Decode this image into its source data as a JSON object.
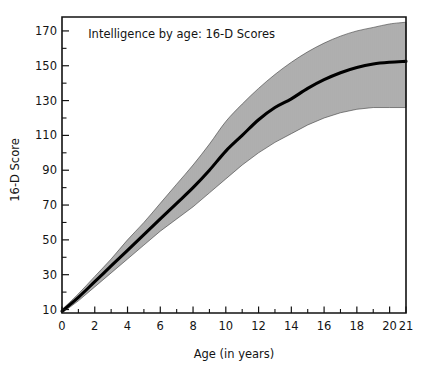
{
  "chart_data": {
    "type": "line",
    "title": "Intelligence by age: 16-D Scores",
    "xlabel": "Age (in years)",
    "ylabel": "16-D Score",
    "grid": false,
    "legend": "none",
    "xlim": [
      0,
      21
    ],
    "ylim": [
      8,
      178
    ],
    "x_ticks": [
      0,
      2,
      4,
      6,
      8,
      10,
      12,
      14,
      16,
      18,
      20,
      21
    ],
    "x_tick_labels": [
      "0",
      "2",
      "4",
      "6",
      "8",
      "10",
      "12",
      "14",
      "16",
      "18",
      "20",
      "21"
    ],
    "x_minor_ticks": [
      1,
      3,
      5,
      7,
      9,
      11,
      13,
      15,
      17,
      19
    ],
    "y_ticks": [
      10,
      30,
      50,
      70,
      90,
      110,
      130,
      150,
      170
    ],
    "y_tick_labels": [
      "10",
      "30",
      "50",
      "70",
      "90",
      "110",
      "130",
      "150",
      "170"
    ],
    "y_minor_ticks": [
      20,
      40,
      60,
      80,
      100,
      120,
      140,
      160
    ],
    "x": [
      0,
      1,
      2,
      3,
      4,
      5,
      6,
      7,
      8,
      9,
      10,
      11,
      12,
      13,
      14,
      15,
      16,
      17,
      18,
      19,
      20,
      21
    ],
    "series": [
      {
        "name": "Mean 16-D Score",
        "values": [
          9,
          17,
          26,
          35,
          44,
          53,
          62,
          71,
          80,
          90,
          101,
          110,
          119,
          126,
          131,
          137,
          142,
          146,
          149,
          151,
          152,
          152.5
        ]
      },
      {
        "name": "Band upper (hatched range)",
        "values": [
          10,
          19,
          29,
          39,
          50,
          60,
          71,
          82,
          93,
          105,
          118,
          128,
          137,
          145,
          152,
          158,
          163,
          167,
          170,
          172,
          174,
          175
        ]
      },
      {
        "name": "Band lower (hatched range)",
        "values": [
          8,
          15,
          23,
          31,
          39,
          47,
          55,
          62,
          69,
          77,
          85,
          93,
          100,
          106,
          111,
          116,
          120,
          123,
          125,
          126,
          126,
          126
        ]
      }
    ],
    "annotations": [
      {
        "text": "Intelligence by age: 16-D Scores",
        "x": 1.6,
        "y": 166
      }
    ],
    "band_fill": "vertical-hatch",
    "band_hatch_spacing_px": 2,
    "mean_line_color": "#000000",
    "frame_color": "#121212",
    "background_color": "#ffffff"
  },
  "figure": {
    "title_text": "Intelligence by age: 16-D Scores",
    "xlabel_text": "Age (in years)",
    "ylabel_text": "16-D Score"
  }
}
